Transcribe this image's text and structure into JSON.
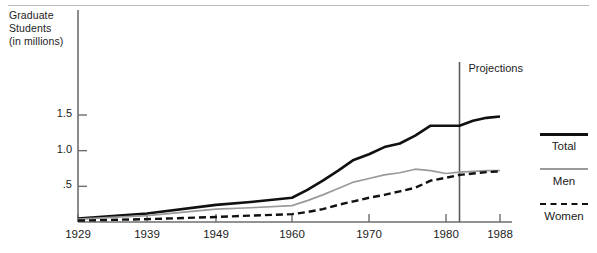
{
  "chart_data": {
    "type": "line",
    "title": "",
    "subtitle": "",
    "xlabel": "",
    "ylabel": "Graduate\nStudents\n(in millions)",
    "xlim": [
      1929,
      1988
    ],
    "ylim": [
      0,
      1.75
    ],
    "grid": false,
    "legend_position": "right",
    "xticks": [
      1929,
      1939,
      1949,
      1960,
      1970,
      1980,
      1988
    ],
    "xtick_labels": [
      "1929",
      "1939",
      "1949",
      "1960",
      "1970",
      "1980",
      "1988"
    ],
    "yticks": [
      0.5,
      1.0,
      1.5
    ],
    "ytick_labels": [
      ".5",
      "1.0",
      "1.5"
    ],
    "annotations": [
      {
        "name": "projections-divider",
        "label": "Projections",
        "x": 1982
      }
    ],
    "x": [
      1929,
      1939,
      1949,
      1954,
      1960,
      1962,
      1964,
      1966,
      1968,
      1970,
      1972,
      1974,
      1976,
      1978,
      1980,
      1982,
      1984,
      1986,
      1988
    ],
    "series": [
      {
        "name": "Total",
        "style": "solid-black",
        "color": "#111111",
        "values": [
          0.05,
          0.12,
          0.24,
          0.28,
          0.34,
          0.45,
          0.58,
          0.72,
          0.87,
          0.95,
          1.05,
          1.1,
          1.21,
          1.35,
          1.35,
          1.35,
          1.42,
          1.46,
          1.48
        ]
      },
      {
        "name": "Men",
        "style": "solid-gray",
        "color": "#9a9a9a",
        "values": [
          0.04,
          0.09,
          0.18,
          0.2,
          0.23,
          0.3,
          0.38,
          0.47,
          0.56,
          0.61,
          0.66,
          0.69,
          0.74,
          0.72,
          0.68,
          0.7,
          0.71,
          0.72,
          0.72
        ]
      },
      {
        "name": "Women",
        "style": "dashed-black",
        "color": "#111111",
        "values": [
          0.02,
          0.04,
          0.07,
          0.09,
          0.11,
          0.14,
          0.18,
          0.24,
          0.29,
          0.34,
          0.38,
          0.43,
          0.48,
          0.58,
          0.62,
          0.66,
          0.68,
          0.7,
          0.71
        ]
      }
    ]
  },
  "axis": {
    "y_title": "Graduate\nStudents\n(in millions)"
  },
  "legend": {
    "entries": [
      {
        "label": "Total",
        "swatch": "solid-thick-black-line"
      },
      {
        "label": "Men",
        "swatch": "solid-thin-gray-line"
      },
      {
        "label": "Women",
        "swatch": "dashed-black-line"
      }
    ]
  },
  "projection": {
    "label": "Projections"
  }
}
